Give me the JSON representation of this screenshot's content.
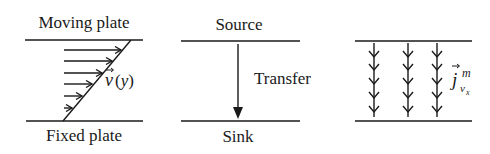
{
  "panels": [
    {
      "id": "couette-flow",
      "top_label": "Moving plate",
      "bottom_label": "Fixed plate",
      "velocity_label": "v",
      "velocity_arg": "(y)",
      "arrow_count": 6
    },
    {
      "id": "source-sink",
      "top_label": "Source",
      "bottom_label": "Sink",
      "arrow_label": "Transfer"
    },
    {
      "id": "momentum-flux",
      "flux_symbol": "j",
      "flux_superscript": "m",
      "flux_subscript": "v",
      "flux_subsubscript": "x",
      "columns": 3,
      "chevrons_per_column": 5
    }
  ]
}
